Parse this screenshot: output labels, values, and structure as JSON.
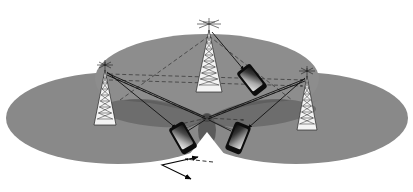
{
  "figure": {
    "domain": "diagram",
    "background_color": "#ffffff",
    "width": 413,
    "height": 192
  },
  "palette": {
    "white": "#ffffff",
    "cell_gray": "#898989",
    "cell_gray_top": "#8d8d8d",
    "cell_overlap": "#7c7c7c",
    "beam_gray": "#6a6a6a",
    "beam_gray_dark": "#5c5c5c",
    "beam_center": "#4e4e4e",
    "tower_fill": "#f2f2f2",
    "tower_stroke": "#2a2a2a",
    "line_solid": "#121212",
    "line_dashed": "#333333",
    "phone_body": "#0d0d0d",
    "phone_screen_light": "#d9d9d9",
    "phone_screen_dark": "#1a1a1a",
    "arrow_black": "#0a0a0a"
  },
  "coverage_cells": [
    {
      "id": "cell-left",
      "label": "left cell coverage area",
      "cx": 118,
      "cy": 118,
      "rx": 112,
      "ry": 46,
      "fill": "#898989"
    },
    {
      "id": "cell-right",
      "label": "right cell coverage area",
      "cx": 296,
      "cy": 118,
      "rx": 112,
      "ry": 46,
      "fill": "#898989"
    },
    {
      "id": "cell-top",
      "label": "top cell coverage area",
      "cx": 207,
      "cy": 79,
      "rx": 112,
      "ry": 45,
      "fill": "#8d8d8d"
    }
  ],
  "towers": [
    {
      "id": "tower-left",
      "label": "base station tower left",
      "x": 105,
      "y_top": 63,
      "height": 62,
      "base_half_width": 12,
      "sectors": 9
    },
    {
      "id": "tower-top",
      "label": "base station tower top",
      "x": 209,
      "y_top": 22,
      "height": 70,
      "base_half_width": 13,
      "sectors": 10
    },
    {
      "id": "tower-right",
      "label": "base station tower right",
      "x": 307,
      "y_top": 70,
      "height": 60,
      "base_half_width": 12,
      "sectors": 9
    }
  ],
  "devices": [
    {
      "id": "phone-upper-right",
      "label": "mobile handset upper right",
      "cx": 252,
      "cy": 80,
      "rotation": -38,
      "w": 15,
      "h": 28
    },
    {
      "id": "phone-lower-left",
      "label": "mobile handset lower left",
      "cx": 183,
      "cy": 138,
      "rotation": -30,
      "w": 15,
      "h": 28
    },
    {
      "id": "phone-lower-right",
      "label": "mobile handset lower right",
      "cx": 238,
      "cy": 138,
      "rotation": 22,
      "w": 15,
      "h": 28
    }
  ],
  "beams": [
    {
      "id": "beam-left-lobe",
      "label": "beam lobe toward left",
      "fill": "#6a6a6a"
    },
    {
      "id": "beam-right-lobe",
      "label": "beam lobe toward right",
      "fill": "#6a6a6a"
    },
    {
      "id": "beam-center",
      "label": "beam focus region",
      "fill": "#4e4e4e"
    }
  ],
  "solid_links": [
    {
      "id": "link-left-to-lower-left",
      "label": "downlink left tower to lower left handset",
      "x1": 107,
      "y1": 72,
      "x2": 176,
      "y2": 128
    },
    {
      "id": "link-top-to-upper-right",
      "label": "downlink top tower to upper right handset",
      "x1": 212,
      "y1": 32,
      "x2": 244,
      "y2": 70
    },
    {
      "id": "link-right-to-lower-right",
      "label": "downlink right tower to lower right handset",
      "x1": 305,
      "y1": 78,
      "x2": 248,
      "y2": 128
    },
    {
      "id": "link-left-to-center",
      "label": "beam edge left tower to focus",
      "x1": 107,
      "y1": 73,
      "x2": 207,
      "y2": 118
    },
    {
      "id": "link-right-to-center",
      "label": "beam edge right tower to focus",
      "x1": 305,
      "y1": 79,
      "x2": 207,
      "y2": 118
    }
  ],
  "dashed_links": [
    {
      "id": "dashed-left-right-upper",
      "label": "interference path left to right tower",
      "x1": 109,
      "y1": 74,
      "x2": 303,
      "y2": 80
    },
    {
      "id": "dashed-left-right-lower",
      "label": "secondary path left to right tower",
      "x1": 109,
      "y1": 80,
      "x2": 303,
      "y2": 86
    },
    {
      "id": "dashed-top-left",
      "label": "interference path top tower to left",
      "x1": 209,
      "y1": 36,
      "x2": 120,
      "y2": 100
    },
    {
      "id": "dashed-top-right",
      "label": "interference path top tower to right",
      "x1": 209,
      "y1": 36,
      "x2": 292,
      "y2": 100
    },
    {
      "id": "dashed-center-left",
      "label": "reflected path toward lower left",
      "x1": 207,
      "y1": 118,
      "x2": 172,
      "y2": 126
    },
    {
      "id": "dashed-center-right",
      "label": "reflected path toward lower right",
      "x1": 207,
      "y1": 118,
      "x2": 244,
      "y2": 120
    }
  ],
  "motion_vectors": [
    {
      "id": "velocity-dashed",
      "label": "predicted movement vector",
      "style": "dashed",
      "x1": 212,
      "y1": 163,
      "x2": 183,
      "y2": 160
    },
    {
      "id": "velocity-solid-a",
      "label": "movement vector segment a",
      "style": "solid",
      "x1": 197,
      "y1": 158,
      "x2": 163,
      "y2": 165
    },
    {
      "id": "velocity-solid-b",
      "label": "movement vector segment b",
      "style": "solid",
      "x1": 163,
      "y1": 165,
      "x2": 190,
      "y2": 178
    }
  ]
}
